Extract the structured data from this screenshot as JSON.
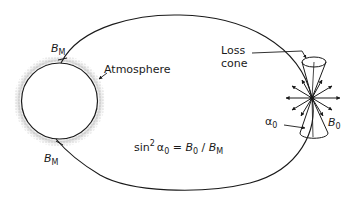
{
  "figure": {
    "colors": {
      "line": "#1a1a1a",
      "background": "#ffffff",
      "atmosphere_stipple": "#9a9a9a"
    }
  },
  "labels": {
    "bm_top": {
      "base": "B",
      "sub": "M"
    },
    "bm_bottom": {
      "base": "B",
      "sub": "M"
    },
    "atmosphere": "Atmosphere",
    "loss_cone_line1": "Loss",
    "loss_cone_line2": "cone",
    "alpha0": {
      "base": "α",
      "sub": "0"
    },
    "b0": {
      "base": "B",
      "sub": "0"
    }
  },
  "equation": {
    "prefix": "sin",
    "exponent": "2",
    "alpha": "α",
    "alpha_sub": "0",
    "equals": " = ",
    "b0_base": "B",
    "b0_sub": "0",
    "slash": " / ",
    "bm_base": "B",
    "bm_sub": "M"
  },
  "elements": {
    "planet": "planet-circle",
    "field_line": "closed-field-line",
    "loss_cone": "double-cone",
    "particle_arrows": "velocity-vector-star"
  }
}
